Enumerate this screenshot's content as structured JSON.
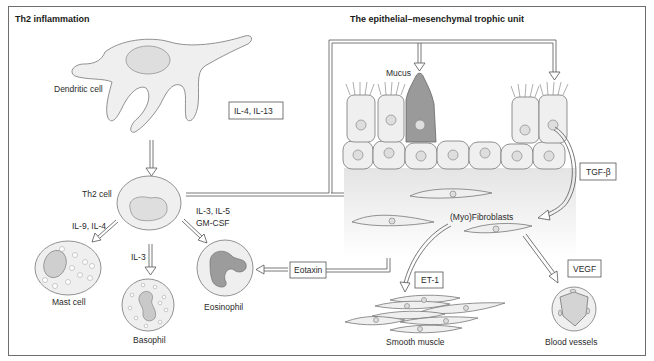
{
  "panels": {
    "left": {
      "title": "Th2 inflammation"
    },
    "right": {
      "title": "The epithelial–mesenchymal trophic unit"
    }
  },
  "cells": {
    "dendritic": "Dendritic cell",
    "th2": "Th2 cell",
    "mast": "Mast cell",
    "basophil": "Basophil",
    "eosinophil": "Eosinophil",
    "mucus": "Mucus",
    "fibroblasts": "(Myo)Fibroblasts",
    "smooth_muscle": "Smooth muscle",
    "blood_vessels": "Blood vessels"
  },
  "mediators": {
    "il4_il13": "IL-4, IL-13",
    "il9_il4": "IL-9, IL-4",
    "il3": "IL-3",
    "il3_il5": "IL-3, IL-5",
    "gmcsf": "GM-CSF",
    "eotaxin": "Eotaxin",
    "tgfb": "TGF-β",
    "et1": "ET-1",
    "vegf": "VEGF"
  },
  "colors": {
    "border": "#6e6e6e",
    "cell_fill": "#efefef",
    "goblet_fill": "#9a9a9a",
    "text": "#2a2a2a"
  }
}
